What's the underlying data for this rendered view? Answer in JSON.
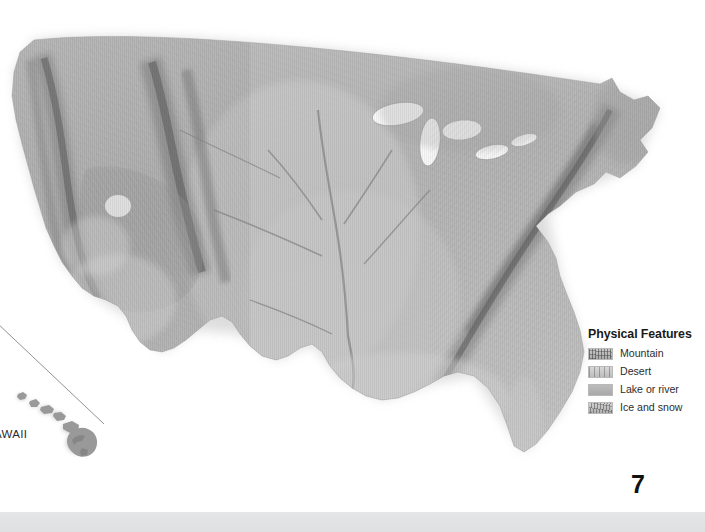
{
  "page": {
    "number": "7",
    "background_color": "#ffffff",
    "footer_bar_color": "#e3e4e5"
  },
  "map": {
    "name": "united-states-physical-relief-map",
    "style": "grayscale shaded relief",
    "land_color": "#b4b4b4",
    "highland_color": "#8a8a8a",
    "water_color": "#ffffff",
    "insets": [
      {
        "name": "hawaii-inset",
        "label": "HAWAII",
        "label_clipped_text": "AWAII"
      }
    ]
  },
  "legend": {
    "title": "Physical Features",
    "items": [
      {
        "label": "Mountain",
        "swatch": "mountain-swatch",
        "color": "#a8a8a8"
      },
      {
        "label": "Desert",
        "swatch": "desert-swatch",
        "color": "#c4c4c4"
      },
      {
        "label": "Lake or river",
        "swatch": "lake-or-river-swatch",
        "color": "#b2b2b2"
      },
      {
        "label": "Ice and snow",
        "swatch": "ice-and-snow-swatch",
        "color": "#c0c0c0"
      }
    ]
  }
}
